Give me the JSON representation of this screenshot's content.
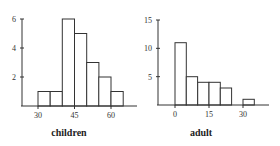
{
  "chart_data": [
    {
      "type": "bar",
      "title": "",
      "xlabel": "children",
      "ylabel": "",
      "bin_edges": [
        30,
        35,
        40,
        45,
        50,
        55,
        60,
        65
      ],
      "categories": [
        "30-35",
        "35-40",
        "40-45",
        "45-50",
        "50-55",
        "55-60",
        "60-65"
      ],
      "values": [
        1,
        1,
        6,
        5,
        3,
        2,
        1
      ],
      "x_ticks": [
        30,
        45,
        60
      ],
      "y_ticks": [
        2,
        4,
        6
      ],
      "xlim": [
        26,
        69
      ],
      "ylim": [
        0,
        6
      ],
      "grid": false,
      "legend": null
    },
    {
      "type": "bar",
      "title": "",
      "xlabel": "adult",
      "ylabel": "",
      "bin_edges": [
        0,
        5,
        10,
        15,
        20,
        25,
        30,
        35
      ],
      "categories": [
        "0-5",
        "5-10",
        "10-15",
        "15-20",
        "20-25",
        "25-30",
        "30-35"
      ],
      "values": [
        11,
        5,
        4,
        4,
        3,
        0,
        1
      ],
      "x_ticks": [
        0,
        15,
        30
      ],
      "y_ticks": [
        5,
        10,
        15
      ],
      "xlim": [
        -8,
        41
      ],
      "ylim": [
        0,
        15
      ],
      "grid": false,
      "legend": null
    }
  ],
  "labels": {
    "left_xlabel": "children",
    "right_xlabel": "adult"
  }
}
